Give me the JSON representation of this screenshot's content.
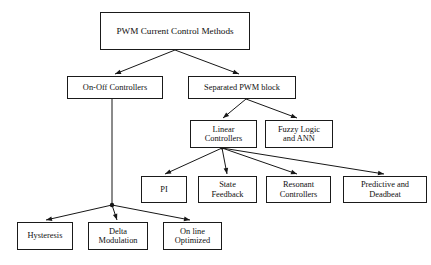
{
  "diagram": {
    "title": "PWM Current Control Methods",
    "type": "tree-hierarchy",
    "background_color": "#ffffff",
    "line_color": "#171717",
    "text_color": "#101010",
    "nodes": [
      {
        "id": "root",
        "label": "PWM Current Control Methods",
        "level": 0,
        "x": 100,
        "y": 12,
        "w": 150,
        "h": 38,
        "font_size": 9.2
      },
      {
        "id": "on-off-controllers",
        "label": "On-Off Controllers",
        "level": 1,
        "x": 67,
        "y": 76,
        "w": 96,
        "h": 23,
        "font_size": 8.4
      },
      {
        "id": "separated-pwm-block",
        "label": "Separated PWM block",
        "level": 1,
        "x": 188,
        "y": 76,
        "w": 108,
        "h": 23,
        "font_size": 8.4
      },
      {
        "id": "linear-controllers",
        "label": "Linear\nControllers",
        "level": 2,
        "x": 190,
        "y": 120,
        "w": 67,
        "h": 28,
        "font_size": 8.4
      },
      {
        "id": "fuzzy-logic-and-ann",
        "label": "Fuzzy Logic\nand ANN",
        "level": 2,
        "x": 265,
        "y": 120,
        "w": 68,
        "h": 28,
        "font_size": 8.4
      },
      {
        "id": "pi",
        "label": "PI",
        "level": 3,
        "x": 141,
        "y": 176,
        "w": 46,
        "h": 27,
        "font_size": 8.4
      },
      {
        "id": "state-feedback",
        "label": "State\nFeedback",
        "level": 3,
        "x": 198,
        "y": 176,
        "w": 59,
        "h": 27,
        "font_size": 8.4
      },
      {
        "id": "resonant-controllers",
        "label": "Resonant\nControllers",
        "level": 3,
        "x": 266,
        "y": 176,
        "w": 65,
        "h": 27,
        "font_size": 8.4
      },
      {
        "id": "predictive-and-deadbeat",
        "label": "Predictive and\nDeadbeat",
        "level": 3,
        "x": 343,
        "y": 176,
        "w": 84,
        "h": 27,
        "font_size": 8.4
      },
      {
        "id": "hysteresis",
        "label": "Hysteresis",
        "level": 2,
        "x": 17,
        "y": 222,
        "w": 56,
        "h": 28,
        "font_size": 8.4
      },
      {
        "id": "delta-modulation",
        "label": "Delta\nModulation",
        "level": 2,
        "x": 88,
        "y": 222,
        "w": 60,
        "h": 28,
        "font_size": 8.4
      },
      {
        "id": "on-line-optimized",
        "label": "On line\nOptimized",
        "level": 2,
        "x": 163,
        "y": 222,
        "w": 59,
        "h": 28,
        "font_size": 8.4
      }
    ],
    "edges": [
      {
        "from": "root",
        "to": "on-off-controllers",
        "junction": [
          175,
          50
        ],
        "tip": [
          115,
          74
        ]
      },
      {
        "from": "root",
        "to": "separated-pwm-block",
        "junction": [
          175,
          50
        ],
        "tip": [
          239,
          74
        ]
      },
      {
        "from": "separated-pwm-block",
        "to": "linear-controllers",
        "junction": [
          246,
          99
        ],
        "tip": [
          223,
          118
        ]
      },
      {
        "from": "separated-pwm-block",
        "to": "fuzzy-logic-and-ann",
        "junction": [
          246,
          99
        ],
        "tip": [
          297,
          118
        ]
      },
      {
        "from": "linear-controllers",
        "to": "pi",
        "junction": [
          222,
          148
        ],
        "tip": [
          165,
          174
        ]
      },
      {
        "from": "linear-controllers",
        "to": "state-feedback",
        "junction": [
          222,
          148
        ],
        "tip": [
          227,
          174
        ]
      },
      {
        "from": "linear-controllers",
        "to": "resonant-controllers",
        "junction": [
          222,
          148
        ],
        "tip": [
          297,
          174
        ]
      },
      {
        "from": "linear-controllers",
        "to": "predictive-and-deadbeat",
        "junction": [
          222,
          148
        ],
        "tip": [
          384,
          174
        ]
      },
      {
        "from": "on-off-controllers",
        "to": "hysteresis",
        "junction": [
          112,
          205
        ],
        "tip": [
          46,
          220
        ]
      },
      {
        "from": "on-off-controllers",
        "to": "delta-modulation",
        "junction": [
          112,
          205
        ],
        "tip": [
          117,
          220
        ]
      },
      {
        "from": "on-off-controllers",
        "to": "on-line-optimized",
        "junction": [
          112,
          205
        ],
        "tip": [
          190,
          220
        ]
      }
    ],
    "stems": [
      {
        "name": "on-off-controllers-stem",
        "x1": 112,
        "y1": 99,
        "x2": 112,
        "y2": 205
      }
    ],
    "junction_dots": [
      {
        "name": "on-off-controllers-junction-dot",
        "x": 112,
        "y": 205,
        "r": 2.2
      },
      {
        "name": "linear-controllers-junction-dot",
        "x": 222,
        "y": 148,
        "r": 1.6
      }
    ]
  }
}
